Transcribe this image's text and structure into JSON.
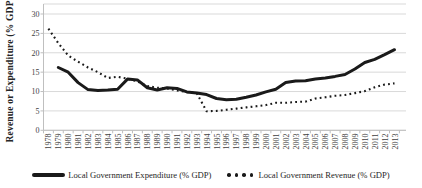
{
  "chart_data": {
    "type": "line",
    "title": "",
    "xlabel": "",
    "ylabel": "Revenue or Expenditure (% GDP)",
    "ylim": [
      0,
      30
    ],
    "yticks": [
      0,
      5,
      10,
      15,
      20,
      25,
      30
    ],
    "grid": "horizontal",
    "legend_position": "bottom",
    "categories": [
      "1978",
      "1979",
      "1980",
      "1981",
      "1982",
      "1983",
      "1984",
      "1985",
      "1986",
      "1987",
      "1988",
      "1989",
      "1990",
      "1991",
      "1992",
      "1993",
      "1994",
      "1995",
      "1996",
      "1997",
      "1998",
      "1999",
      "2000",
      "2001",
      "2002",
      "2003",
      "2004",
      "2005",
      "2006",
      "2007",
      "2008",
      "2009",
      "2010",
      "2011",
      "2012",
      "2013"
    ],
    "series": [
      {
        "name": "Local Government Expenditure (% GDP)",
        "style": "solid",
        "values": [
          null,
          16.2,
          15.0,
          12.3,
          10.5,
          10.3,
          10.4,
          10.6,
          13.2,
          13.0,
          11.0,
          10.4,
          11.0,
          10.8,
          9.9,
          9.6,
          9.2,
          8.2,
          7.9,
          8.0,
          8.5,
          9.1,
          9.9,
          10.6,
          12.3,
          12.7,
          12.8,
          13.2,
          13.5,
          13.9,
          14.4,
          15.8,
          17.5,
          18.3,
          19.5,
          20.8
        ]
      },
      {
        "name": "Local Government Revenue (% GDP)",
        "style": "dotted",
        "values": [
          26.2,
          22.5,
          19.3,
          17.7,
          16.2,
          15.0,
          13.5,
          13.8,
          13.3,
          12.6,
          11.4,
          11.0,
          10.8,
          10.3,
          9.9,
          9.6,
          4.9,
          5.0,
          5.3,
          5.6,
          5.9,
          6.2,
          6.5,
          7.1,
          7.1,
          7.3,
          7.4,
          8.2,
          8.5,
          8.9,
          9.1,
          9.6,
          10.1,
          11.1,
          11.8,
          12.1
        ]
      }
    ]
  },
  "colors": {
    "line": "#1a1a1a",
    "grid": "#d9d9d9",
    "axis": "#bfbfbf",
    "tick_text": "#3f3f3f",
    "legend_text": "#262626",
    "background": "#ffffff"
  }
}
